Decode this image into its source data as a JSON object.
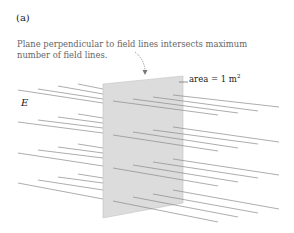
{
  "figure": {
    "panel_label": "(a)",
    "caption": "Plane perpendicular to field lines intersects maximum number of field lines.",
    "field_label": "E",
    "area_label": {
      "text": "area = 1 m",
      "superscript": "2"
    }
  },
  "colors": {
    "plane_fill": "#dcdcdc",
    "plane_stroke": "#bbbbbb",
    "field_line": "#8a8a8a",
    "arrow": "#777777"
  }
}
